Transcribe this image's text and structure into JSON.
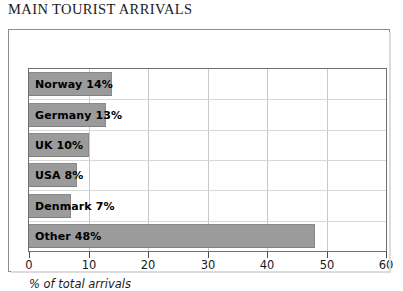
{
  "chart_data": {
    "type": "bar",
    "orientation": "horizontal",
    "title": "MAIN TOURIST ARRIVALS",
    "xlabel": "% of total arrivals",
    "ylabel": "",
    "xlim": [
      0,
      60
    ],
    "xticks": [
      0,
      10,
      20,
      30,
      40,
      50,
      60
    ],
    "xtick_labels": [
      "0",
      "10",
      "20",
      "30",
      "40",
      "50",
      "60"
    ],
    "grid": true,
    "legend": "none",
    "categories": [
      "Norway",
      "Germany",
      "UK",
      "USA",
      "Denmark",
      "Other"
    ],
    "values": [
      14,
      13,
      10,
      8,
      7,
      48
    ],
    "bar_labels": [
      "Norway 14%",
      "Germany 13%",
      "UK 10%",
      "USA 8%",
      "Denmark 7%",
      "Other 48%"
    ],
    "bar_color": "#9b9b9b",
    "background_color": "#ffffff",
    "axis_color": "#6f6f6f",
    "gridline_color": "#c9c9c9",
    "text_color": "#000000"
  }
}
